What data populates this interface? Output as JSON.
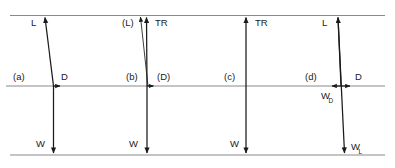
{
  "figure": {
    "type": "force-vector-diagram",
    "background_color": "#ffffff",
    "line_color": "#7a7a7a",
    "vector_color": "#1a1a1a",
    "text_color": "#1a1a1a",
    "guides": {
      "top_line_label": "top-reference-line",
      "mid_line_label": "mid-reference-line",
      "bottom_line_label": "bottom-reference-line"
    },
    "panels": [
      {
        "id": "a",
        "tag": "(a)",
        "vectors": [
          {
            "name": "lift",
            "label": "L"
          },
          {
            "name": "drag",
            "label": "D"
          },
          {
            "name": "weight",
            "label": "W"
          }
        ]
      },
      {
        "id": "b",
        "tag": "(b)",
        "vectors": [
          {
            "name": "lift-parenthetical",
            "label": "(L)"
          },
          {
            "name": "thrust",
            "label": "TR"
          },
          {
            "name": "drag-parenthetical",
            "label": "(D)"
          },
          {
            "name": "weight",
            "label": "W"
          }
        ]
      },
      {
        "id": "c",
        "tag": "(c)",
        "vectors": [
          {
            "name": "thrust",
            "label": "TR"
          },
          {
            "name": "weight",
            "label": "W"
          }
        ]
      },
      {
        "id": "d",
        "tag": "(d)",
        "vectors": [
          {
            "name": "lift",
            "label": "L"
          },
          {
            "name": "drag",
            "label": "D"
          },
          {
            "name": "weight-drag-component",
            "label": "W",
            "subscript": "D"
          },
          {
            "name": "weight-lift-component",
            "label": "W",
            "subscript": "L"
          }
        ]
      }
    ],
    "labels": {
      "panel_a_tag": "(a)",
      "panel_a_lift": "L",
      "panel_a_drag": "D",
      "panel_a_weight": "W",
      "panel_b_tag": "(b)",
      "panel_b_lift": "(L)",
      "panel_b_thrust": "TR",
      "panel_b_drag": "(D)",
      "panel_b_weight": "W",
      "panel_c_tag": "(c)",
      "panel_c_thrust": "TR",
      "panel_c_weight": "W",
      "panel_d_tag": "(d)",
      "panel_d_lift": "L",
      "panel_d_drag": "D",
      "panel_d_wd_base": "W",
      "panel_d_wd_sub": "D",
      "panel_d_wl_base": "W",
      "panel_d_wl_sub": "L"
    }
  }
}
